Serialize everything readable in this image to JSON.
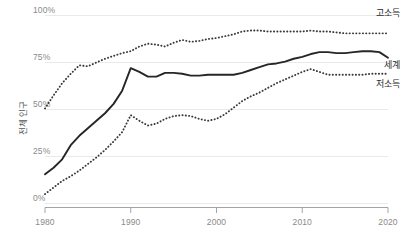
{
  "chart_data": {
    "type": "line",
    "title": "",
    "subtitle": "",
    "xlabel": "",
    "ylabel": "전체 인구",
    "xlim": [
      1980,
      2020
    ],
    "ylim": [
      0,
      100
    ],
    "grid": true,
    "legend_position": "right-inline",
    "y_tick_labels": [
      "100%",
      "75%",
      "50%",
      "25%",
      "0%"
    ],
    "y_tick_values": [
      100,
      75,
      50,
      25,
      0
    ],
    "x_tick_labels": [
      "1980",
      "1990",
      "2000",
      "2010",
      "2020"
    ],
    "x_tick_values": [
      1980,
      1990,
      2000,
      2010,
      2020
    ],
    "x": [
      1980,
      1981,
      1982,
      1983,
      1984,
      1985,
      1986,
      1987,
      1988,
      1989,
      1990,
      1991,
      1992,
      1993,
      1994,
      1995,
      1996,
      1997,
      1998,
      1999,
      2000,
      2001,
      2002,
      2003,
      2004,
      2005,
      2006,
      2007,
      2008,
      2009,
      2010,
      2011,
      2012,
      2013,
      2014,
      2015,
      2016,
      2017,
      2018,
      2019,
      2020
    ],
    "series": [
      {
        "name": "고소득",
        "label": "고소득",
        "style": "dotted",
        "color": "#3a3a3a",
        "values": [
          50.5,
          57.5,
          64.0,
          69.0,
          73.5,
          73.0,
          75.0,
          77.0,
          78.5,
          80.0,
          81.0,
          83.5,
          85.0,
          84.5,
          83.5,
          85.5,
          87.0,
          86.0,
          86.5,
          87.5,
          88.0,
          89.0,
          90.0,
          91.5,
          92.0,
          92.0,
          91.5,
          91.5,
          91.5,
          91.5,
          91.5,
          92.0,
          91.5,
          91.5,
          91.0,
          90.5,
          90.5,
          90.5,
          90.5,
          90.5,
          90.5
        ]
      },
      {
        "name": "세계",
        "label": "세계",
        "style": "solid",
        "color": "#262626",
        "values": [
          15.5,
          19.0,
          23.5,
          31.0,
          36.0,
          40.0,
          44.0,
          48.0,
          53.0,
          60.0,
          72.0,
          70.0,
          67.5,
          67.5,
          69.5,
          69.5,
          69.0,
          68.0,
          68.0,
          68.5,
          68.5,
          68.5,
          68.5,
          69.5,
          71.0,
          72.5,
          74.0,
          74.5,
          75.5,
          77.0,
          78.0,
          79.5,
          80.5,
          80.5,
          80.0,
          80.0,
          80.5,
          81.0,
          81.0,
          80.5,
          77.5
        ]
      },
      {
        "name": "저소득",
        "label": "저소득",
        "style": "dotted",
        "color": "#3a3a3a",
        "values": [
          5.0,
          8.5,
          12.0,
          14.5,
          17.5,
          21.0,
          24.5,
          28.5,
          33.0,
          38.0,
          47.0,
          44.0,
          41.5,
          42.5,
          45.0,
          46.5,
          47.0,
          46.5,
          45.0,
          44.0,
          45.0,
          47.5,
          51.0,
          54.5,
          57.0,
          59.0,
          61.5,
          64.0,
          66.0,
          68.0,
          70.0,
          71.5,
          70.0,
          68.5,
          68.5,
          68.5,
          68.5,
          68.5,
          69.0,
          69.0,
          69.0
        ]
      }
    ],
    "annotations": [
      {
        "name": "고소득",
        "x": 2020,
        "y": 100
      },
      {
        "name": "세계",
        "x": 2020,
        "y": 72
      },
      {
        "name": "저소득",
        "x": 2020,
        "y": 62
      }
    ]
  },
  "axes": {
    "y_label": "전체 인구",
    "y_ticks": [
      {
        "label": "100%",
        "value": 100
      },
      {
        "label": "75%",
        "value": 75
      },
      {
        "label": "50%",
        "value": 50
      },
      {
        "label": "25%",
        "value": 25
      },
      {
        "label": "0%",
        "value": 0
      }
    ],
    "x_ticks": [
      {
        "label": "1980",
        "value": 1980
      },
      {
        "label": "1990",
        "value": 1990
      },
      {
        "label": "2000",
        "value": 2000
      },
      {
        "label": "2010",
        "value": 2010
      },
      {
        "label": "2020",
        "value": 2020
      }
    ]
  },
  "legend": {
    "high_income": "고소득",
    "world": "세계",
    "low_income": "저소득"
  }
}
